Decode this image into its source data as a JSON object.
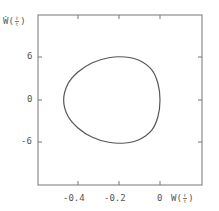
{
  "chart_data": {
    "type": "line",
    "title": "",
    "xlabel": "W(ℓ/t)",
    "ylabel": "Ẇ(ℓ/t)",
    "xlabel_parts": {
      "base": "W",
      "num": "ℓ",
      "den": "t"
    },
    "ylabel_parts": {
      "base": "Ẇ",
      "num": "ℓ",
      "den": "t"
    },
    "x_ticks": [
      "-0.4",
      "-0.2",
      "0"
    ],
    "x_tick_values": [
      -0.4,
      -0.2,
      0
    ],
    "y_ticks": [
      "6",
      "0",
      "-6"
    ],
    "y_tick_values": [
      6,
      0,
      -6
    ],
    "xlim": [
      -0.6,
      0.2
    ],
    "ylim": [
      -12,
      12
    ],
    "grid": false,
    "legend": null,
    "series": [
      {
        "name": "phase trajectory (closed loop)",
        "x": [
          -0.47,
          -0.45,
          -0.4,
          -0.33,
          -0.25,
          -0.17,
          -0.1,
          -0.04,
          -0.01,
          0.0,
          -0.01,
          -0.04,
          -0.1,
          -0.17,
          -0.25,
          -0.33,
          -0.4,
          -0.45,
          -0.47
        ],
        "y": [
          0,
          2.2,
          3.9,
          5.2,
          5.9,
          6.0,
          5.5,
          4.2,
          2.3,
          0,
          -2.3,
          -4.2,
          -5.5,
          -6.0,
          -5.9,
          -5.2,
          -3.9,
          -2.2,
          0
        ]
      }
    ],
    "color": "#555555"
  }
}
